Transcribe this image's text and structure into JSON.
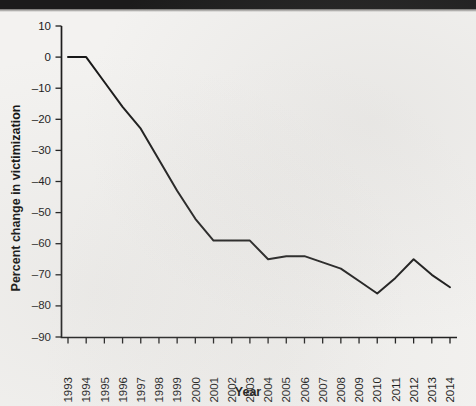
{
  "page": {
    "background_color": "#f3f2f0",
    "scan_band_color": "#1b1b1b"
  },
  "chart_data": {
    "type": "line",
    "title": "",
    "subtitle": "",
    "xlabel": "Year",
    "ylabel": "Percent change in victimization",
    "categories": [
      "1993",
      "1994",
      "1995",
      "1996",
      "1997",
      "1998",
      "1999",
      "2000",
      "2001",
      "2002",
      "2003",
      "2004",
      "2005",
      "2006",
      "2007",
      "2008",
      "2009",
      "2010",
      "2011",
      "2012",
      "2013",
      "2014"
    ],
    "values": [
      0,
      0,
      -8,
      -16,
      -23,
      -33,
      -43,
      -52,
      -59,
      -59,
      -59,
      -65,
      -64,
      -64,
      -66,
      -68,
      -72,
      -76,
      -71,
      -65,
      -70,
      -74
    ],
    "series": [
      {
        "name": "Percent change in victimization",
        "color": "#181818",
        "values": [
          0,
          0,
          -8,
          -16,
          -23,
          -33,
          -43,
          -52,
          -59,
          -59,
          -59,
          -65,
          -64,
          -64,
          -66,
          -68,
          -72,
          -76,
          -71,
          -65,
          -70,
          -74
        ]
      }
    ],
    "xlim": [
      1993,
      2014
    ],
    "ylim": [
      -90,
      10
    ],
    "ytick_labels": [
      "10",
      "0",
      "–10",
      "–20",
      "–30",
      "–40",
      "–50",
      "–60",
      "–70",
      "–80",
      "–90"
    ],
    "ytick_values": [
      10,
      0,
      -10,
      -20,
      -30,
      -40,
      -50,
      -60,
      -70,
      -80,
      -90
    ],
    "grid": false,
    "legend": false,
    "legend_position": "none",
    "markers": false,
    "line_color": "#181818"
  }
}
